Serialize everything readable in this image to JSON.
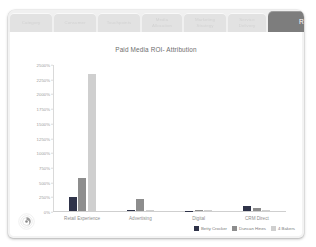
{
  "window": {
    "tabs": [
      {
        "label": "Category",
        "active": false,
        "width": 42
      },
      {
        "label": "Consumer",
        "active": false,
        "width": 42
      },
      {
        "label": "Touchpoints",
        "active": false,
        "width": 42
      },
      {
        "label": "Media\nAllocation",
        "active": false,
        "width": 40
      },
      {
        "label": "Marketing\nStrategy",
        "active": false,
        "width": 42
      },
      {
        "label": "Service\nDelivery",
        "active": false,
        "width": 38
      },
      {
        "label": "Reports",
        "active": true,
        "width": 86
      }
    ]
  },
  "chart_data": {
    "type": "bar",
    "title": "Paid Media ROI- Attribution",
    "xlabel": "",
    "ylabel": "",
    "grid": false,
    "legend_position": "bottom-right",
    "categories": [
      "Retail Experience",
      "Advertising",
      "Digital",
      "CRM Direct"
    ],
    "ytick_labels": [
      "2500%",
      "2250%",
      "2000%",
      "1750%",
      "1500%",
      "1250%",
      "1000%",
      "750%",
      "500%",
      "250%",
      "0%"
    ],
    "ytick_values": [
      2500,
      2250,
      2000,
      1750,
      1500,
      1250,
      1000,
      750,
      500,
      250,
      0
    ],
    "ylim": [
      0,
      2500
    ],
    "series": [
      {
        "name": "Betty Crocker",
        "color": "#2f3349",
        "values": [
          250,
          20,
          15,
          95
        ]
      },
      {
        "name": "Duncan Hines",
        "color": "#8d8d8d",
        "values": [
          570,
          215,
          30,
          60
        ]
      },
      {
        "name": "4 Bakers",
        "color": "#cfcfcf",
        "values": [
          2340,
          25,
          20,
          25
        ]
      }
    ]
  },
  "logo": {
    "name": "circular-brand-watermark"
  }
}
